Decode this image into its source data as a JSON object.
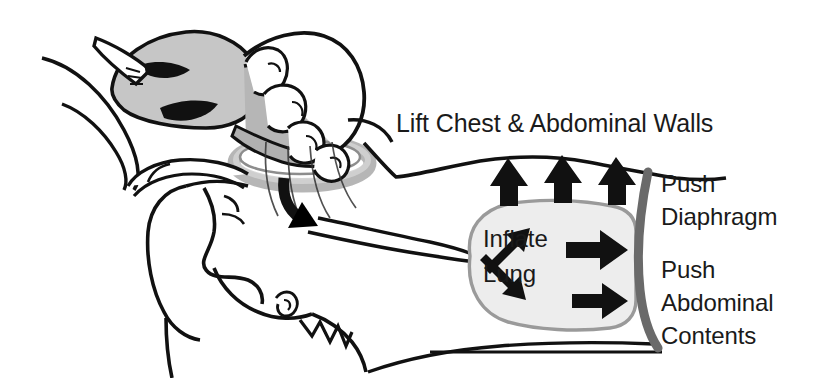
{
  "illustration": {
    "title_text": "Lift Chest & Abdominal Walls",
    "subject": "bag-valve-mask-ventilation",
    "background_color": "#ffffff"
  },
  "labels": {
    "title": "Lift Chest & Abdominal Walls",
    "inflate_line1": "Inflate",
    "inflate_line2": "Lung",
    "push_diaphragm_line1": "Push",
    "push_diaphragm_line2": "Diaphragm",
    "push_abdominal_line1": "Push",
    "push_abdominal_line2": "Abdominal",
    "push_abdominal_line3": "Contents"
  },
  "colors": {
    "ink": "#111111",
    "text": "#1a1a1a",
    "bag_fill": "#c6c6c6",
    "bag_shade": "#a8a8a8",
    "mask_ring": "#8f8f8f",
    "mask_ring_light": "#bdbdbd",
    "lung_fill": "#ededed",
    "lung_outline": "#9a9a9a",
    "diaphragm": "#6a6a6a",
    "white": "#ffffff"
  },
  "parts": {
    "rescuer_hand": "hand-squeezing-bag",
    "resuscitator_bag": "bag-valve-device",
    "face_mask": "face-mask-ring",
    "patient_head": "patient-head-profile",
    "patient_torso": "patient-torso",
    "airway": "trachea-airway",
    "lung": "lung",
    "diaphragm": "diaphragm-line",
    "chest_wall": "chest-abdominal-wall"
  },
  "arrows": {
    "airflow_into_airway": "curved-down-arrow",
    "bronchus_upper": "up-right-arrow",
    "bronchus_lower": "down-right-arrow",
    "lung_to_diaphragm_upper": "right-arrow",
    "lung_to_diaphragm_lower": "right-arrow",
    "chest_lift_1": "up-arrow",
    "chest_lift_2": "up-arrow",
    "chest_lift_3": "up-arrow",
    "chest_lift_count": 3
  }
}
